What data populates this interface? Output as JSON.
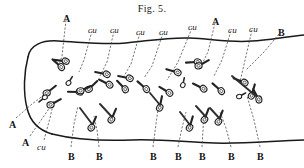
{
  "figure": {
    "title": "Fig. 5.",
    "caption_position": "top-center",
    "ink_color": "#1a1a1a",
    "background_color": "#ffffff"
  },
  "labels": {
    "top": [
      {
        "text": "A",
        "x": 63,
        "y": 14,
        "style": "cap"
      },
      {
        "text": "cu",
        "x": 88,
        "y": 26,
        "style": "cu"
      },
      {
        "text": "cu",
        "x": 110,
        "y": 26,
        "style": "cu"
      },
      {
        "text": "cu",
        "x": 136,
        "y": 28,
        "style": "cu"
      },
      {
        "text": "cu",
        "x": 159,
        "y": 28,
        "style": "cu"
      },
      {
        "text": "cu",
        "x": 188,
        "y": 23,
        "style": "cu"
      },
      {
        "text": "A",
        "x": 212,
        "y": 17,
        "style": "cap"
      },
      {
        "text": "cu",
        "x": 228,
        "y": 26,
        "style": "cu"
      },
      {
        "text": "cu",
        "x": 249,
        "y": 25,
        "style": "cu"
      },
      {
        "text": "B",
        "x": 278,
        "y": 28,
        "style": "cap"
      }
    ],
    "left": [
      {
        "text": "A",
        "x": 9,
        "y": 120,
        "style": "cap"
      },
      {
        "text": "A",
        "x": 22,
        "y": 138,
        "style": "cap"
      },
      {
        "text": "cu",
        "x": 37,
        "y": 143,
        "style": "cu"
      }
    ],
    "bottom": [
      {
        "text": "B",
        "x": 68,
        "y": 152,
        "style": "cap"
      },
      {
        "text": "B",
        "x": 96,
        "y": 152,
        "style": "cap"
      },
      {
        "text": "B",
        "x": 150,
        "y": 152,
        "style": "cap"
      },
      {
        "text": "B",
        "x": 175,
        "y": 152,
        "style": "cap"
      },
      {
        "text": "B",
        "x": 199,
        "y": 152,
        "style": "cap"
      },
      {
        "text": "B",
        "x": 228,
        "y": 152,
        "style": "cap"
      },
      {
        "text": "B",
        "x": 257,
        "y": 152,
        "style": "cap"
      }
    ]
  },
  "legend_keys": [
    {
      "key": "A",
      "meaning_visible": "A"
    },
    {
      "key": "B",
      "meaning_visible": "B"
    },
    {
      "key": "cu",
      "meaning_visible": "cu"
    }
  ],
  "counts": {
    "label_A": 3,
    "label_B": 8,
    "label_cu": 8
  }
}
